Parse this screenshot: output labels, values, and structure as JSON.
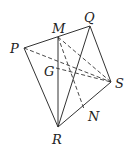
{
  "figure": {
    "points": {
      "P": {
        "label": "P",
        "x": 24,
        "y": 48
      },
      "Q": {
        "label": "Q",
        "x": 90,
        "y": 26
      },
      "M": {
        "label": "M",
        "x": 58,
        "y": 37
      },
      "R": {
        "label": "R",
        "x": 58,
        "y": 127
      },
      "S": {
        "label": "S",
        "x": 111,
        "y": 82
      },
      "N": {
        "label": "N",
        "x": 84,
        "y": 109
      },
      "G": {
        "label": "G",
        "x": 75,
        "y": 73
      }
    },
    "labels": {
      "P": "P",
      "Q": "Q",
      "M": "M",
      "R": "R",
      "S": "S",
      "N": "N",
      "G": "G"
    },
    "solid_edges": [
      [
        "P",
        "Q"
      ],
      [
        "P",
        "R"
      ],
      [
        "Q",
        "R"
      ],
      [
        "Q",
        "S"
      ],
      [
        "R",
        "S"
      ],
      [
        "M",
        "R"
      ]
    ],
    "dashed_edges": [
      [
        "P",
        "S"
      ],
      [
        "M",
        "S"
      ],
      [
        "M",
        "N"
      ],
      [
        "G",
        "S"
      ]
    ]
  }
}
